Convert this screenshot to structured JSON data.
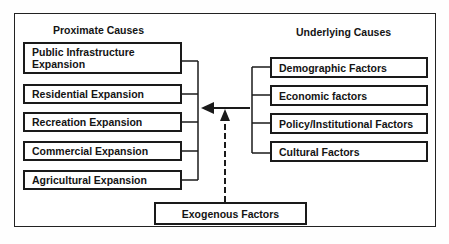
{
  "diagram": {
    "left_heading": "Proximate Causes",
    "right_heading": "Underlying Causes",
    "proximate_causes": [
      {
        "label": "Public Infrastructure Expansion",
        "line1": "Public Infrastructure",
        "line2": "Expansion"
      },
      {
        "label": "Residential Expansion"
      },
      {
        "label": "Recreation Expansion"
      },
      {
        "label": "Commercial Expansion"
      },
      {
        "label": "Agricultural Expansion"
      }
    ],
    "underlying_causes": [
      {
        "label": "Demographic Factors"
      },
      {
        "label": "Economic factors"
      },
      {
        "label": "Policy/Institutional Factors"
      },
      {
        "label": "Cultural Factors"
      }
    ],
    "exogenous": {
      "label": "Exogenous Factors"
    },
    "connections": [
      {
        "from": "underlying_causes",
        "to": "proximate_causes",
        "style": "solid-arrow"
      },
      {
        "from": "exogenous",
        "to": "proximate_causes",
        "style": "dashed-arrow"
      }
    ]
  }
}
